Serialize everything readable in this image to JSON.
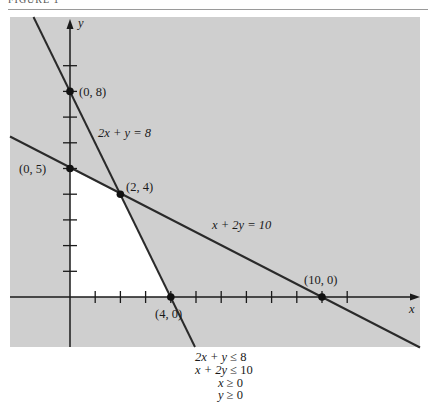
{
  "header": {
    "figure_label": "FIGURE 1"
  },
  "colors": {
    "infeasible_shade": "#cfcfcf",
    "feasible_region": "#ffffff",
    "lines": "#2a2a2a",
    "points": "#111111"
  },
  "diagram": {
    "axes": {
      "x_label": "x",
      "y_label": "y",
      "x_ticks": [
        1,
        2,
        3,
        4,
        5,
        6,
        7,
        8,
        9,
        10,
        11
      ],
      "y_ticks": [
        1,
        2,
        3,
        4,
        5,
        6,
        7,
        8,
        9
      ]
    },
    "lines": [
      {
        "equation": "2x + y = 8",
        "label": "2x + y = 8"
      },
      {
        "equation": "x + 2y = 10",
        "label": "x + 2y = 10"
      }
    ],
    "points": [
      {
        "label": "(0, 8)",
        "x": 0,
        "y": 8
      },
      {
        "label": "(0, 5)",
        "x": 0,
        "y": 5
      },
      {
        "label": "(2, 4)",
        "x": 2,
        "y": 4
      },
      {
        "label": "(4, 0)",
        "x": 4,
        "y": 0
      },
      {
        "label": "(10, 0)",
        "x": 10,
        "y": 0
      }
    ],
    "feasible_vertices": [
      "(0, 0)",
      "(0, 5)",
      "(2, 4)",
      "(4, 0)"
    ]
  },
  "constraints": [
    {
      "lhs": "2x + y",
      "op": "≤",
      "rhs": "8"
    },
    {
      "lhs": "x + 2y",
      "op": "≤",
      "rhs": "10"
    },
    {
      "lhs": "x",
      "op": "≥",
      "rhs": "0"
    },
    {
      "lhs": "y",
      "op": "≥",
      "rhs": "0"
    }
  ]
}
